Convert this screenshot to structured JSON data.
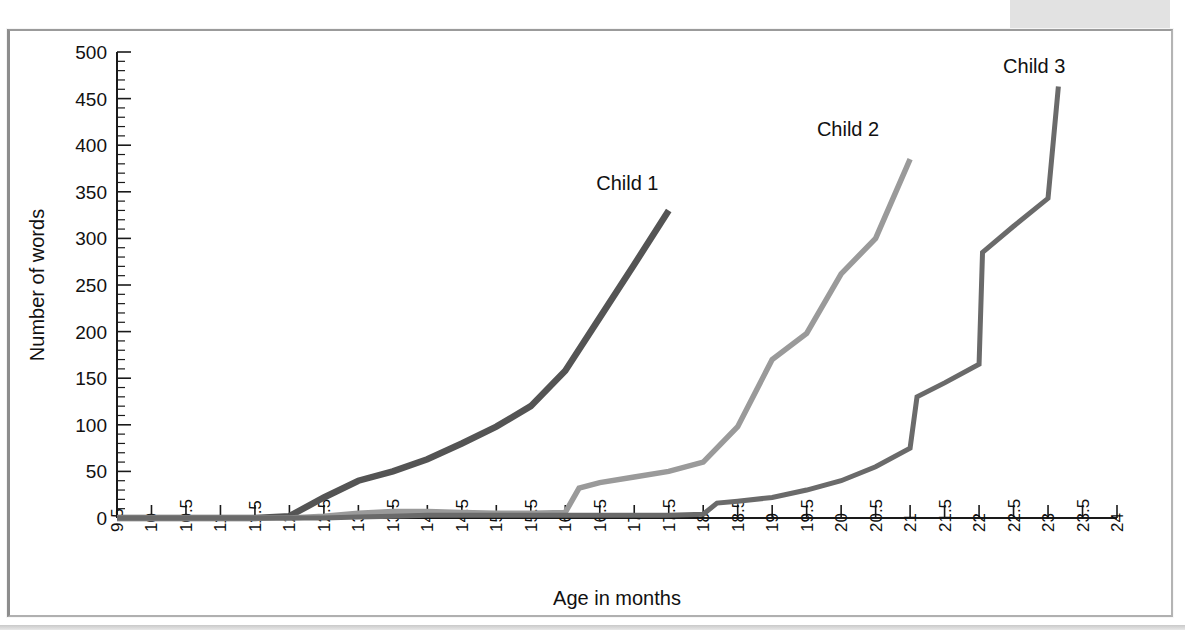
{
  "chart_data": {
    "type": "line",
    "title": "",
    "xlabel": "Age in months",
    "ylabel": "Number of words",
    "xlim": [
      9.5,
      24
    ],
    "ylim": [
      0,
      500
    ],
    "xtick_step": 0.5,
    "ytick_step": 50,
    "y_minor_step": 10,
    "grid": false,
    "legend_position": "inline-end-of-line",
    "xticks": [
      "9.5",
      "10",
      "10.5",
      "11",
      "11.5",
      "12",
      "12.5",
      "13",
      "13.5",
      "14",
      "14.5",
      "15",
      "15.5",
      "16",
      "16.5",
      "17",
      "17.5",
      "18",
      "18.5",
      "19",
      "19.5",
      "20",
      "20.5",
      "21",
      "21.5",
      "22",
      "22.5",
      "23",
      "23.5",
      "24"
    ],
    "yticks": [
      "0",
      "50",
      "100",
      "150",
      "200",
      "250",
      "300",
      "350",
      "400",
      "450",
      "500"
    ],
    "series": [
      {
        "name": "Child 1",
        "color": "#545454",
        "label_x": 16.9,
        "label_y": 352,
        "x": [
          9.5,
          10,
          10.5,
          11,
          11.5,
          12,
          12.5,
          13,
          13.5,
          14,
          14.5,
          15,
          15.5,
          16,
          16.5,
          17,
          17.5
        ],
        "y": [
          0,
          0,
          0,
          0,
          0,
          2,
          22,
          40,
          50,
          63,
          80,
          98,
          120,
          158,
          215,
          272,
          330
        ]
      },
      {
        "name": "Child 2",
        "color": "#9a9a9a",
        "label_x": 20.1,
        "label_y": 410,
        "x": [
          9.5,
          10,
          10.5,
          11,
          11.5,
          12,
          12.5,
          13,
          13.5,
          14,
          14.5,
          15,
          15.5,
          16,
          16.2,
          16.5,
          17,
          17.5,
          18,
          18.5,
          19,
          19.5,
          20,
          20.5,
          21
        ],
        "y": [
          0,
          0,
          0,
          0,
          0,
          0,
          2,
          5,
          7,
          7,
          6,
          5,
          5,
          6,
          32,
          38,
          44,
          50,
          60,
          98,
          170,
          198,
          262,
          300,
          385
        ]
      },
      {
        "name": "Child 3",
        "color": "#6a6a6a",
        "label_x": 22.8,
        "label_y": 478,
        "x": [
          9.5,
          10,
          10.5,
          11,
          11.5,
          12,
          12.5,
          13,
          13.5,
          14,
          14.5,
          15,
          15.5,
          16,
          16.5,
          17,
          17.5,
          18,
          18.2,
          18.5,
          19,
          19.5,
          20,
          20.5,
          21,
          21.1,
          21.5,
          22,
          22.05,
          22.5,
          23,
          23.15
        ],
        "y": [
          0,
          0,
          0,
          0,
          0,
          0,
          0,
          1,
          2,
          3,
          3,
          3,
          3,
          3,
          3,
          3,
          3,
          4,
          16,
          18,
          22,
          30,
          40,
          55,
          75,
          130,
          145,
          165,
          285,
          313,
          343,
          463
        ]
      }
    ]
  },
  "axes": {
    "y_axis_title": "Number of words",
    "x_axis_title": "Age in months"
  }
}
